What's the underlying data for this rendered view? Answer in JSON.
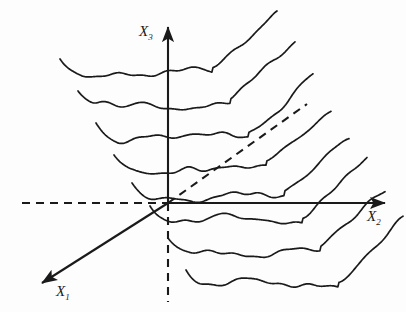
{
  "figure": {
    "title": "",
    "kind": "3d-axes-curve-sheaf",
    "background_color": "#fdfdfd",
    "stroke_color": "#1a1a1a",
    "axes": {
      "x1": {
        "label_base": "X",
        "label_sub": "1",
        "label": "X1",
        "origin": [
          168,
          203
        ],
        "tip": [
          42,
          283
        ],
        "style": "solid",
        "arrow": true
      },
      "x2": {
        "label_base": "X",
        "label_sub": "2",
        "label": "X2",
        "origin": [
          168,
          203
        ],
        "tip": [
          385,
          203
        ],
        "style": "solid",
        "arrow": true
      },
      "x3": {
        "label_base": "X",
        "label_sub": "3",
        "label": "X3",
        "origin": [
          168,
          203
        ],
        "tip": [
          168,
          27
        ],
        "style": "solid",
        "arrow": true
      }
    },
    "guides": [
      {
        "name": "x2-negative-dashed",
        "from": [
          22,
          203
        ],
        "to": [
          168,
          203
        ],
        "style": "dashed"
      },
      {
        "name": "x3-negative-dashed",
        "from": [
          168,
          203
        ],
        "to": [
          168,
          302
        ],
        "style": "dashed"
      },
      {
        "name": "x1-negative-dashed-diagonal",
        "from": [
          168,
          203
        ],
        "to": [
          307,
          104
        ],
        "style": "dashed"
      }
    ],
    "curves": {
      "count": 8,
      "description": "stack of wavy sigmoid/staircase profile curves receding along the X1 depth axis",
      "depth_shift_x": 18,
      "depth_shift_y": -32,
      "baselines_y": [
        73,
        105,
        137,
        169,
        197,
        220,
        252,
        284
      ],
      "left_x": [
        60,
        78,
        96,
        114,
        132,
        150,
        168,
        186
      ],
      "right_x": [
        277,
        295,
        313,
        331,
        349,
        367,
        385,
        403
      ],
      "rise_amount": 66,
      "ripple_amplitude": 3.2,
      "ripple_count": 7,
      "left_hook_drop": 14
    }
  },
  "labels": {
    "x1": "X1",
    "x2": "X2",
    "x3": "X3"
  }
}
